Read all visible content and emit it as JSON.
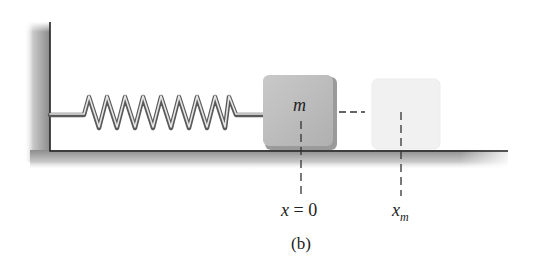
{
  "figure": {
    "caption": "(b)",
    "block_label": "m",
    "origin_label_var": "x",
    "origin_label_eq": " = 0",
    "max_label_var": "x",
    "max_label_sub": "m"
  },
  "colors": {
    "wall_shade": "#8a8a8a",
    "floor_shade": "#8c8c8c",
    "block_fill": "#bdbdbd",
    "ghost_fill": "#f1f1f1",
    "spring": "#6e6e6e",
    "line": "#222222"
  }
}
